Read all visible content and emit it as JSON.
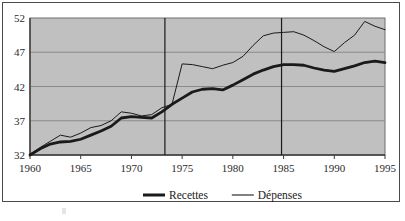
{
  "chart_data": {
    "type": "line",
    "title": "",
    "subtitle": "",
    "xlabel": "",
    "ylabel": "",
    "xlim": [
      1960,
      1995
    ],
    "ylim": [
      32,
      52
    ],
    "xticks": [
      "1960",
      "1965",
      "1970",
      "1975",
      "1980",
      "1985",
      "1990",
      "1995"
    ],
    "xtick_values": [
      1960,
      1965,
      1970,
      1975,
      1980,
      1985,
      1990,
      1995
    ],
    "yticks": [
      "32",
      "37",
      "42",
      "47",
      "52"
    ],
    "ytick_values": [
      32,
      37,
      42,
      47,
      52
    ],
    "grid": "horizontal",
    "legend_position": "bottom",
    "plot_background": "#c0c0c0",
    "line_color": "#1a1a1a",
    "x": [
      1960,
      1961,
      1962,
      1963,
      1964,
      1965,
      1966,
      1967,
      1968,
      1969,
      1970,
      1971,
      1972,
      1973,
      1974,
      1975,
      1976,
      1977,
      1978,
      1979,
      1980,
      1981,
      1982,
      1983,
      1984,
      1985,
      1986,
      1987,
      1988,
      1989,
      1990,
      1991,
      1992,
      1993,
      1994,
      1995
    ],
    "series": [
      {
        "name": "Recettes",
        "style": "thick",
        "values": [
          32.0,
          32.9,
          33.6,
          33.9,
          34.0,
          34.3,
          34.9,
          35.5,
          36.2,
          37.4,
          37.6,
          37.5,
          37.4,
          38.3,
          39.4,
          40.3,
          41.2,
          41.6,
          41.7,
          41.5,
          42.2,
          43.0,
          43.8,
          44.4,
          44.9,
          45.2,
          45.2,
          45.1,
          44.7,
          44.4,
          44.2,
          44.6,
          45.0,
          45.5,
          45.7,
          45.5
        ]
      },
      {
        "name": "Dépenses",
        "style": "thin",
        "values": [
          32.1,
          33.1,
          34.0,
          34.9,
          34.6,
          35.2,
          36.0,
          36.3,
          37.0,
          38.3,
          38.1,
          37.7,
          37.9,
          38.9,
          39.4,
          45.3,
          45.2,
          44.9,
          44.6,
          45.1,
          45.5,
          46.4,
          48.0,
          49.4,
          49.8,
          49.9,
          50.0,
          49.5,
          48.7,
          47.8,
          47.1,
          48.4,
          49.5,
          51.5,
          50.8,
          50.3
        ]
      }
    ],
    "reference_lines": [
      {
        "x": 1973.3,
        "orientation": "vertical"
      },
      {
        "x": 1984.8,
        "orientation": "vertical"
      }
    ],
    "legend": [
      {
        "label": "Recettes",
        "style": "thick"
      },
      {
        "label": "Dépenses",
        "style": "thin"
      }
    ]
  }
}
